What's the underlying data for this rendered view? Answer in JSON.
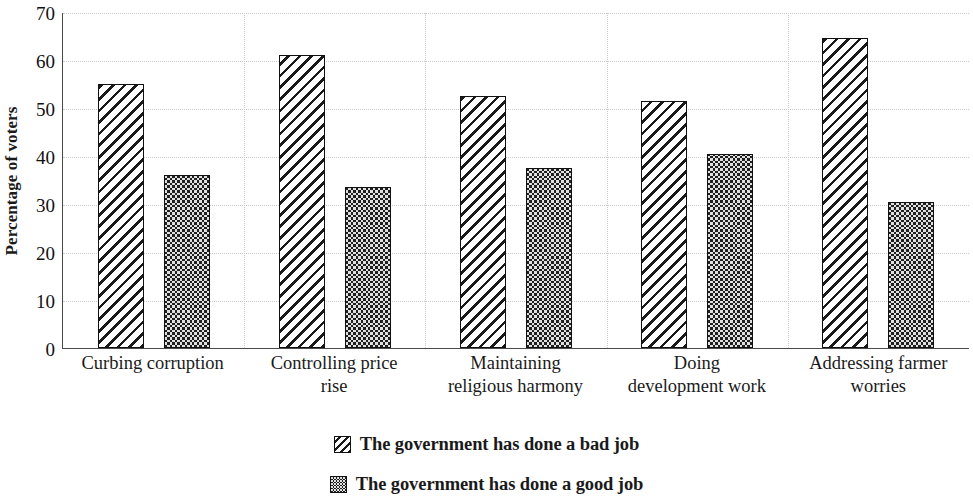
{
  "chart_data": {
    "type": "bar",
    "title": "",
    "subtitle": "",
    "xlabel": "",
    "ylabel": "Percentage of voters",
    "ylim": [
      0,
      70
    ],
    "yticks": [
      0,
      10,
      20,
      30,
      40,
      50,
      60,
      70
    ],
    "ytick_labels": [
      "0",
      "10",
      "20",
      "30",
      "40",
      "50",
      "60",
      "70"
    ],
    "grid": true,
    "legend_position": "bottom",
    "categories": [
      "Curbing corruption",
      "Controlling price rise",
      "Maintaining religious harmony",
      "Doing development work",
      "Addressing farmer worries"
    ],
    "category_lines": [
      [
        "Curbing corruption"
      ],
      [
        "Controlling price",
        "rise"
      ],
      [
        "Maintaining",
        "religious harmony"
      ],
      [
        "Doing",
        "development work"
      ],
      [
        "Addressing farmer",
        "worries"
      ]
    ],
    "series": [
      {
        "name": "The government has done a bad job",
        "pattern": "diagonal-hatch",
        "values": [
          55,
          61,
          52.5,
          51.5,
          64.5
        ]
      },
      {
        "name": "The government has done a good job",
        "pattern": "checkerboard",
        "values": [
          36,
          33.5,
          37.5,
          40.5,
          30.5
        ]
      }
    ]
  },
  "legend": {
    "items": [
      {
        "label": "The government has done a bad job",
        "swatch": "hatch"
      },
      {
        "label": "The government has done a good job",
        "swatch": "check"
      }
    ]
  },
  "colors": {
    "ink": "#1a1a1a",
    "axis": "#4a4a4a",
    "gridline": "#c9c9c9",
    "background": "#ffffff"
  }
}
